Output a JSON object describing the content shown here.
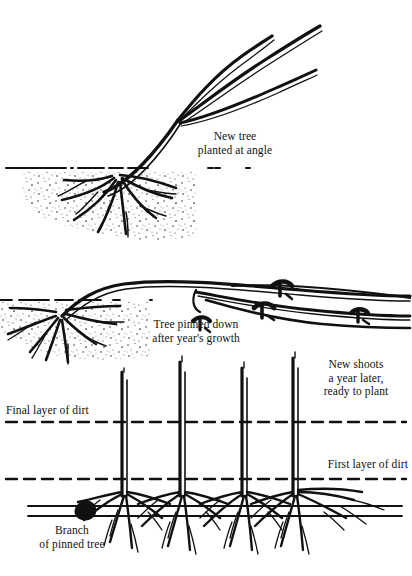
{
  "figure": {
    "ink_color": "#111111",
    "background_color": "#ffffff"
  },
  "captions": {
    "new_tree": "New tree\nplanted at angle",
    "pinned_down": "Tree pinned down\nafter year's growth",
    "new_shoots": "New shoots\na year later,\nready to plant",
    "final_layer": "Final layer of dirt",
    "first_layer": "First layer of dirt",
    "branch": "Branch\nof pinned tree"
  },
  "panels": [
    {
      "name": "panel-new-tree-planted-at-angle",
      "caption_key": "new_tree"
    },
    {
      "name": "panel-tree-pinned-down",
      "caption_key": "pinned_down"
    },
    {
      "name": "panel-new-shoots-ready-to-plant",
      "caption_key": "new_shoots"
    }
  ]
}
